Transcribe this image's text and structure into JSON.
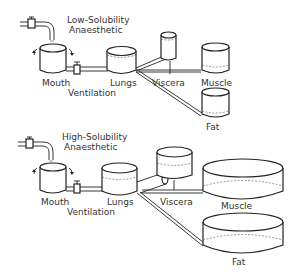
{
  "diagrams": [
    {
      "title_line1": "Low-Solubility",
      "title_line2": "Anaesthetic",
      "labels": {
        "mouth": "Mouth",
        "ventilation": "Ventilation",
        "lungs": "Lungs",
        "viscera": "Viscera",
        "muscle": "Muscle",
        "fat": "Fat"
      }
    },
    {
      "title_line1": "High-Solubility",
      "title_line2": "Anaesthetic",
      "labels": {
        "mouth": "Mouth",
        "ventilation": "Ventilation",
        "lungs": "Lungs",
        "viscera": "Viscera",
        "muscle": "Muscle",
        "fat": "Fat"
      }
    }
  ]
}
